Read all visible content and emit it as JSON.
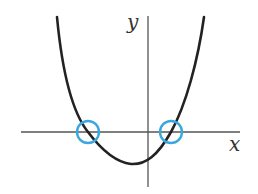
{
  "diagram": {
    "title": "",
    "axes": {
      "x_label": "x",
      "y_label": "y",
      "color": "#555555"
    },
    "curve": {
      "type": "quartic-like parabola",
      "color": "#222222",
      "min_point_description": "minimum below x-axis, slightly left of y-axis"
    },
    "highlights": [
      {
        "name": "left-root",
        "description": "x-intercept (negative root)",
        "color": "#3aa8e0"
      },
      {
        "name": "right-root",
        "description": "x-intercept (positive root)",
        "color": "#3aa8e0"
      }
    ]
  }
}
